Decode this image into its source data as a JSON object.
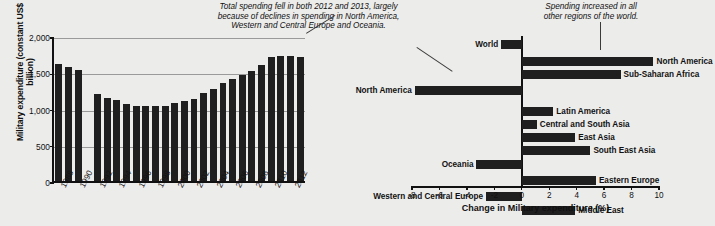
{
  "annotations": [
    {
      "id": "left-annotation",
      "text": "Total spending fell in both 2012 and 2013, largely\nbecause of declines in spending in North America,\nWestern and Central Europe and Oceania."
    },
    {
      "id": "right-annotation",
      "text": "Spending increased in all\nother regions of the world."
    }
  ],
  "chart_data": [
    {
      "id": "military-expenditure-trend",
      "type": "bar",
      "title": "",
      "xlabel": "",
      "ylabel": "Military expenditure (constant US$ billion)",
      "ylim": [
        0,
        2000
      ],
      "yticks": [
        0,
        500,
        1000,
        1500,
        2000
      ],
      "ytick_labels": [
        "0",
        "500",
        "1,000",
        "1,500",
        "2,000"
      ],
      "grid": true,
      "categories": [
        "1988",
        "1989",
        "1990",
        "1991",
        "1992",
        "1993",
        "1994",
        "1995",
        "1996",
        "1997",
        "1998",
        "1999",
        "2000",
        "2001",
        "2002",
        "2003",
        "2004",
        "2005",
        "2006",
        "2007",
        "2008",
        "2009",
        "2010",
        "2011",
        "2012",
        "2013"
      ],
      "xtick_labels": [
        "1988",
        "1990",
        "1992",
        "1994",
        "1996",
        "1998",
        "2000",
        "2002",
        "2004",
        "2006",
        "2008",
        "2010",
        "2012"
      ],
      "values": [
        1610,
        1570,
        1525,
        null,
        1195,
        1150,
        1115,
        1060,
        1035,
        1035,
        1035,
        1040,
        1070,
        1100,
        1135,
        1210,
        1275,
        1350,
        1410,
        1465,
        1520,
        1595,
        1705,
        1725,
        1730,
        1705
      ]
    },
    {
      "id": "change-in-military-expenditure",
      "type": "bar",
      "orientation": "horizontal",
      "title": "",
      "xlabel": "Change in Military expenditure (%)",
      "ylabel": "",
      "xlim": [
        -8,
        10
      ],
      "xticks": [
        -8,
        -6,
        -4,
        -2,
        0,
        2,
        4,
        6,
        8,
        10
      ],
      "xtick_labels": [
        "-8",
        "-6",
        "-4",
        "-2",
        "0",
        "2",
        "4",
        "6",
        "8",
        "10"
      ],
      "grid": false,
      "categories": [
        "World",
        "North America",
        "Sub-Saharan Africa",
        "North America",
        "Latin America",
        "Central and South Asia",
        "East Asia",
        "South East Asia",
        "Oceania",
        "Eastern Europe",
        "Western and Central Europe",
        "Middle East"
      ],
      "values": [
        -1.5,
        9.6,
        7.2,
        -7.8,
        2.3,
        1.1,
        3.9,
        5.0,
        -3.3,
        5.4,
        -2.6,
        3.9
      ]
    }
  ]
}
